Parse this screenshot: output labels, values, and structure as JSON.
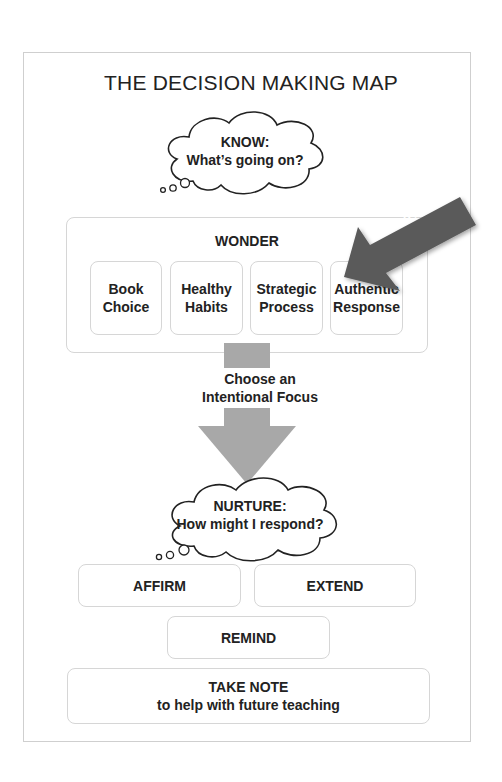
{
  "diagram": {
    "title": "THE DECISION MAKING MAP",
    "know_cloud": {
      "heading": "KNOW:",
      "question": "What’s going on?"
    },
    "wonder": {
      "title": "WONDER",
      "items": [
        {
          "line1": "Book",
          "line2": "Choice"
        },
        {
          "line1": "Healthy",
          "line2": "Habits"
        },
        {
          "line1": "Strategic",
          "line2": "Process"
        },
        {
          "line1": "Authentic",
          "line2": "Response"
        }
      ]
    },
    "you_are_here": "You Are Here",
    "focus": {
      "line1": "Choose an",
      "line2": "Intentional Focus"
    },
    "nurture_cloud": {
      "heading": "NURTURE:",
      "question": "How might I respond?"
    },
    "responses": {
      "affirm": "AFFIRM",
      "extend": "EXTEND",
      "remind": "REMIND"
    },
    "take_note": {
      "title": "TAKE NOTE",
      "subtitle": "to help with future teaching"
    },
    "colors": {
      "arrow_gray": "#a8a8a8",
      "pointer_gray": "#5a5a5a",
      "box_border": "#d6d6d6",
      "text": "#222222"
    }
  }
}
